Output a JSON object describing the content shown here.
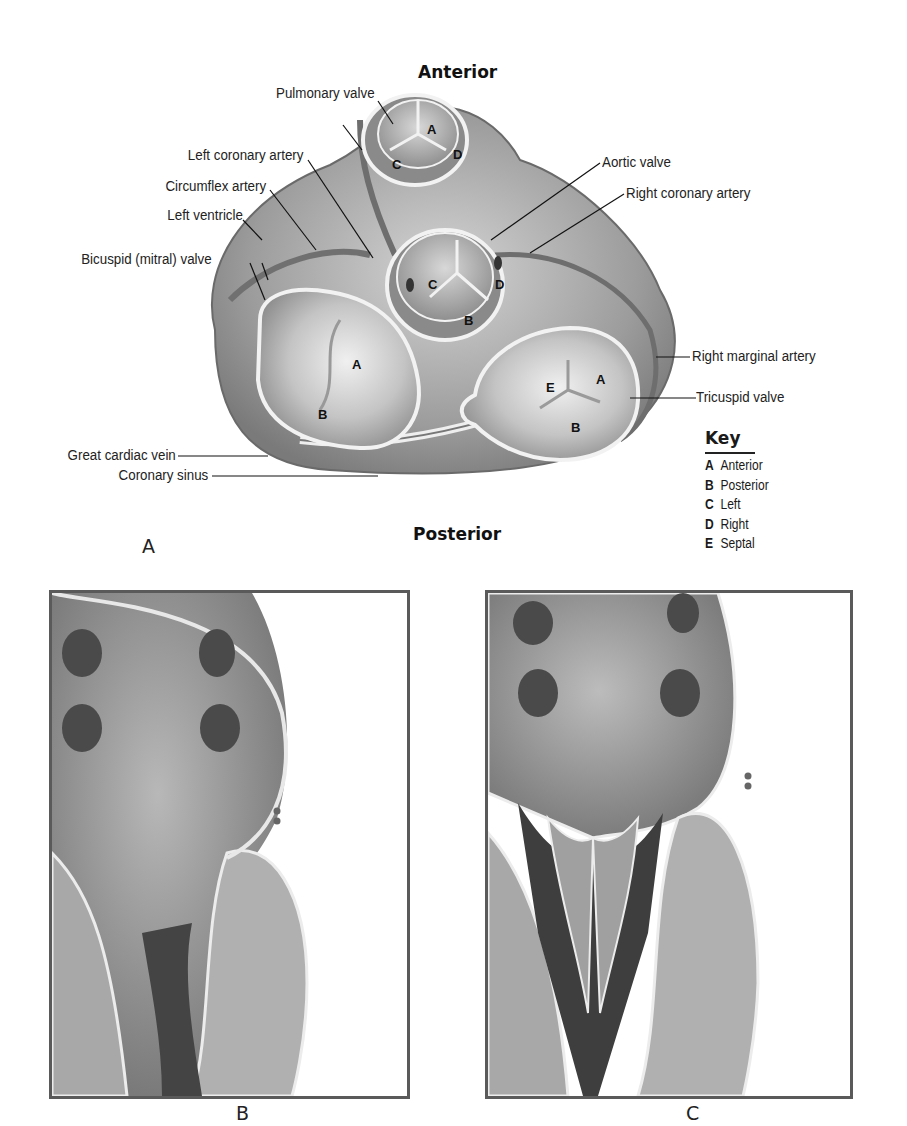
{
  "figure_a": {
    "panel_letter": "A",
    "orientation": {
      "top": "Anterior",
      "bottom": "Posterior"
    },
    "labels_left": [
      {
        "id": "pulmonary-valve",
        "text": "Pulmonary valve"
      },
      {
        "id": "left-coronary-artery",
        "text": "Left coronary artery"
      },
      {
        "id": "circumflex-artery",
        "text": "Circumflex artery"
      },
      {
        "id": "left-ventricle",
        "text": "Left ventricle"
      },
      {
        "id": "bicuspid-valve",
        "text": "Bicuspid (mitral) valve"
      },
      {
        "id": "great-cardiac-vein",
        "text": "Great cardiac vein"
      },
      {
        "id": "coronary-sinus",
        "text": "Coronary sinus"
      }
    ],
    "labels_right": [
      {
        "id": "aortic-valve",
        "text": "Aortic valve"
      },
      {
        "id": "right-coronary-artery",
        "text": "Right coronary artery"
      },
      {
        "id": "right-marginal-artery",
        "text": "Right marginal artery"
      },
      {
        "id": "tricuspid-valve",
        "text": "Tricuspid valve"
      }
    ],
    "cusp_letters": {
      "pulmonary": [
        "A",
        "C",
        "D"
      ],
      "aortic": [
        "C",
        "D",
        "B"
      ],
      "mitral": [
        "A",
        "B"
      ],
      "tricuspid": [
        "E",
        "A",
        "B"
      ]
    },
    "key": {
      "title": "Key",
      "items": [
        {
          "letter": "A",
          "meaning": "Anterior"
        },
        {
          "letter": "B",
          "meaning": "Posterior"
        },
        {
          "letter": "C",
          "meaning": "Left"
        },
        {
          "letter": "D",
          "meaning": "Right"
        },
        {
          "letter": "E",
          "meaning": "Septal"
        }
      ]
    }
  },
  "figure_b": {
    "panel_letter": "B"
  },
  "figure_c": {
    "panel_letter": "C"
  },
  "colors": {
    "tissue_light": "#c8c8c8",
    "tissue_mid": "#9a9a9a",
    "tissue_dark": "#5e5e5e",
    "frame": "#5a5a5a",
    "rim": "#f2f2f2"
  }
}
